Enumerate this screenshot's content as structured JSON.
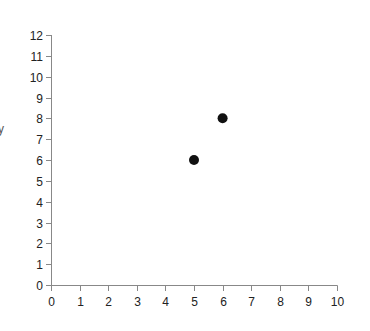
{
  "chart_data": {
    "type": "scatter",
    "title": "",
    "xlabel": "",
    "ylabel": "y",
    "xlim": [
      0,
      10
    ],
    "ylim": [
      0,
      12
    ],
    "x_ticks": [
      "0",
      "1",
      "2",
      "3",
      "4",
      "5",
      "6",
      "7",
      "8",
      "9",
      "10"
    ],
    "y_ticks": [
      "0",
      "1",
      "2",
      "3",
      "4",
      "5",
      "6",
      "7",
      "8",
      "9",
      "10",
      "11",
      "12"
    ],
    "grid": false,
    "legend": null,
    "series": [
      {
        "name": "points",
        "color": "#111111",
        "points": [
          {
            "x": 5,
            "y": 6
          },
          {
            "x": 6,
            "y": 8
          }
        ]
      }
    ]
  },
  "layout": {
    "origin_px": [
      51,
      285
    ],
    "x_max_px": 337,
    "y_max_px": 35,
    "point_radius": 5
  }
}
